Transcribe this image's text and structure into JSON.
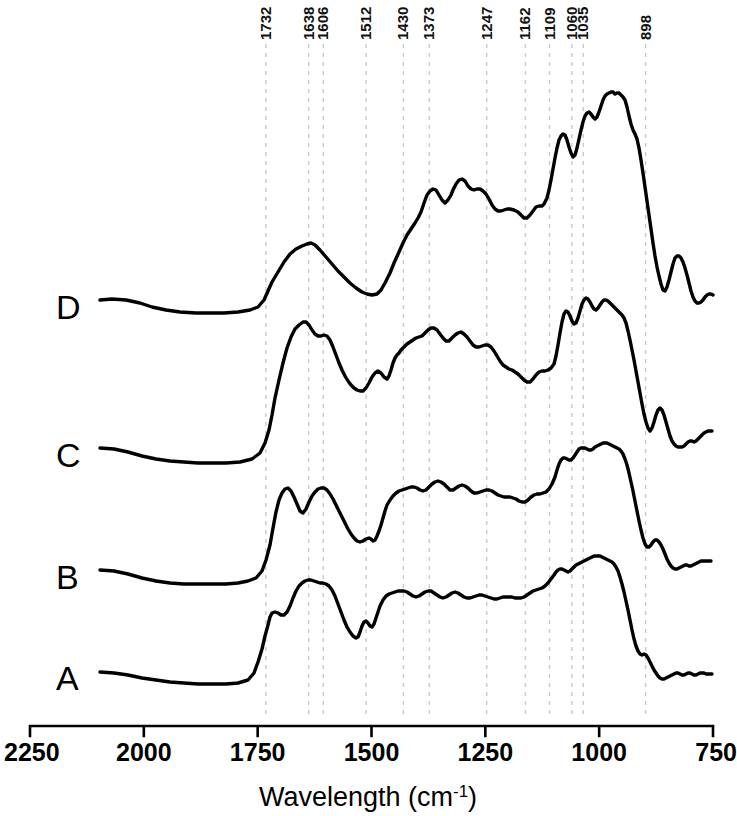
{
  "chart_data": {
    "type": "line",
    "title": "",
    "xlabel": "Wavelength (cm-1)",
    "xlabel_main": "Wavelength  (cm",
    "xlabel_sup": "-1",
    "xlabel_close": ")",
    "ylabel": "",
    "xlim": [
      2250,
      750
    ],
    "x_reversed": true,
    "grid": false,
    "legend_position": "inline-left",
    "xticks": [
      2250,
      2000,
      1750,
      1500,
      1250,
      1000,
      750
    ],
    "xtick_labels": [
      "2250",
      "2000",
      "1750",
      "1500",
      "1250",
      "1000",
      "750"
    ],
    "peak_annotations": [
      {
        "label": "1732",
        "wavenumber": 1732
      },
      {
        "label": "1638",
        "wavenumber": 1638
      },
      {
        "label": "1606",
        "wavenumber": 1606
      },
      {
        "label": "1512",
        "wavenumber": 1512
      },
      {
        "label": "1430",
        "wavenumber": 1430
      },
      {
        "label": "1373",
        "wavenumber": 1373
      },
      {
        "label": "1247",
        "wavenumber": 1247
      },
      {
        "label": "1162",
        "wavenumber": 1162
      },
      {
        "label": "1109",
        "wavenumber": 1109
      },
      {
        "label": "1060",
        "wavenumber": 1060
      },
      {
        "label": "1035",
        "wavenumber": 1035
      },
      {
        "label": "898",
        "wavenumber": 898
      }
    ],
    "series": [
      {
        "name": "D",
        "label": "D",
        "baseline_y": 307,
        "points": "100,300 112,299 126,300 140,303 152,307 166,310 180,312 196,313 210,313 224,313 238,312 250,310 258,307 264,300 268,291 272,282 278,272 284,262 290,254 296,249 302,246 307,244 311,243 315,245 320,250 326,257 332,264 338,271 344,277 350,283 356,288 362,292 367,294 372,295 377,294 381,290 385,283 390,273 394,263 399,252 403,243 407,235 411,229 415,223 418,218 421,212 424,203 427,195 430,191 433,189 436,190 439,195 442,200 445,203 448,200 451,195 453,190 456,184 459,180 462,179 465,181 468,186 471,189 474,190 477,189 480,189 483,191 486,194 489,199 492,205 495,209 498,211 501,211 504,210 507,209 510,209 514,210 518,212 521,215 524,218 527,218 530,215 533,211 536,207 539,206 542,206 544,204 547,198 549,190 551,180 553,169 555,158 557,148 559,140 561,136 563,134 565,135 567,140 569,147 571,153 573,157 575,155 577,148 579,139 581,130 583,122 585,116 587,113 589,112 591,114 593,117 595,119 597,117 599,112 601,106 603,100 605,96 607,94 609,93 611,92 613,92 615,94 617,93 619,93 621,95 623,97 625,100 627,107 629,116 631,124 633,130 635,134 637,139 639,148 641,160 643,173 645,187 647,201 649,215 651,229 653,243 655,256 657,267 659,276 661,284 663,290 665,291 667,287 669,280 671,272 673,264 675,258 677,256 679,256 681,258 683,262 685,268 687,275 689,283 691,291 693,297 695,301 697,303 699,303 701,302 703,300 705,297 707,295 709,294 711,294 713,295"
      },
      {
        "name": "C",
        "label": "C",
        "baseline_y": 455,
        "points": "100,448 114,449 128,452 142,456 156,459 170,461 184,462 198,463 212,463 226,463 240,462 252,459 260,453 265,443 269,430 272,415 275,398 279,380 283,363 287,348 291,337 295,329 299,325 303,322 306,322 309,325 312,330 315,334 318,336 321,336 324,335 327,336 330,340 333,347 336,355 339,363 342,370 345,376 348,381 351,385 354,388 357,390 360,391 363,391 366,388 369,383 372,377 375,373 378,371 381,373 384,377 387,379 389,376 391,370 393,363 395,358 397,355 399,353 401,350 404,347 407,344 410,342 413,340 416,338 419,337 422,336 425,333 428,330 431,328 434,328 437,330 440,334 443,338 446,341 449,341 452,338 455,335 458,333 461,332 464,334 467,337 470,341 473,345 476,347 479,347 482,346 485,345 488,345 491,347 494,351 497,356 500,361 503,365 506,367 509,369 512,370 515,372 518,374 521,377 524,380 527,382 530,382 533,379 536,375 539,372 542,371 545,371 548,370 551,368 554,364 556,356 558,345 560,333 562,322 564,314 566,311 568,312 570,316 572,321 574,324 576,323 578,318 580,311 582,304 584,300 586,298 588,299 590,302 592,306 594,309 596,310 598,308 600,305 602,302 604,300 606,300 608,301 610,303 612,305 614,307 616,309 618,311 620,313 622,315 624,318 626,323 628,331 630,340 632,350 634,360 636,371 638,382 640,393 642,404 644,414 646,422 648,428 650,431 652,428 654,422 656,415 658,410 660,408 662,410 664,415 666,422 668,429 670,436 672,441 674,444 676,446 678,447 680,447 682,447 684,446 686,444 688,442 690,441 692,441 694,442 696,441 698,439 700,437 702,435 704,433 706,432 708,431 710,431 712,431"
      },
      {
        "name": "B",
        "label": "B",
        "baseline_y": 577,
        "points": "100,570 114,571 128,574 142,578 156,581 170,583 184,584 198,584 212,584 226,584 238,583 248,581 256,578 262,571 266,560 270,545 273,528 276,512 279,500 282,493 285,489 288,488 291,491 294,497 297,504 300,511 303,513 306,509 309,502 312,496 315,492 318,489 321,488 324,488 327,490 330,494 333,499 336,505 339,511 342,517 345,523 348,529 351,534 354,538 357,541 360,542 363,541 366,539 369,538 371,539 373,541 375,540 377,536 379,531 381,525 383,518 385,511 387,505 390,500 393,496 396,493 399,491 402,490 405,489 408,488 411,487 414,487 417,488 420,490 423,491 426,490 429,487 432,484 435,482 438,481 441,482 444,484 447,487 450,490 453,490 456,488 459,486 462,485 465,486 468,488 471,491 474,493 477,493 480,492 483,491 486,490 489,490 492,491 495,493 498,495 501,496 504,497 507,497 510,497 513,498 516,499 519,501 522,502 525,502 528,500 531,497 534,495 537,494 540,494 543,493 546,492 549,489 552,484 555,477 557,470 559,464 561,460 563,458 565,458 567,459 569,460 571,460 573,458 575,455 577,452 579,449 581,448 583,448 585,448 587,449 589,450 591,450 593,449 595,447 597,446 599,445 601,444 603,443 605,443 607,443 609,444 611,445 613,446 615,447 617,448 619,449 621,451 623,454 625,459 627,465 629,473 631,482 633,491 635,501 637,511 639,521 641,530 643,538 645,544 647,547 649,547 651,545 653,542 655,540 657,540 659,542 661,545 663,549 665,554 667,559 669,563 671,566 673,568 675,569 677,569 679,568 681,567 683,566 685,565 687,565 689,566 691,566 693,565 695,564 697,563 699,562 701,561 703,561 705,561 707,561 709,561 711,561"
      },
      {
        "name": "A",
        "label": "A",
        "baseline_y": 678,
        "points": "100,672 114,673 128,675 142,678 156,680 170,682 184,683 198,684 212,684 226,684 238,683 248,680 254,673 258,662 262,649 265,636 268,625 270,617 272,613 275,612 278,613 281,615 284,615 287,612 290,606 293,598 296,591 299,586 302,583 305,581 308,580 311,580 314,581 317,582 320,583 323,583 326,584 329,586 332,590 335,596 338,604 341,612 344,620 347,627 350,632 353,636 356,638 358,637 360,632 362,626 364,622 366,621 368,623 370,626 372,627 374,624 376,618 378,612 380,606 383,600 386,596 389,594 392,593 395,592 398,591 401,591 404,591 407,592 410,594 413,596 416,597 419,596 422,594 425,592 428,591 431,591 434,593 437,595 440,597 443,598 446,597 449,595 452,593 455,592 458,593 461,595 464,597 467,598 470,598 473,597 476,596 479,595 482,595 485,596 488,597 491,598 494,599 497,599 500,598 503,597 506,597 509,597 512,597 515,598 518,598 521,598 524,597 527,595 530,593 533,591 536,590 539,589 542,588 545,586 548,583 551,579 554,575 556,572 558,570 560,569 562,569 564,570 566,571 568,572 570,571 572,569 574,567 576,565 578,564 580,563 582,562 584,561 586,560 588,559 590,558 592,557 594,556 596,556 598,556 600,556 602,557 604,558 606,559 608,560 610,561 612,562 614,564 616,567 618,571 620,577 622,584 624,592 626,601 628,610 630,620 632,630 634,639 636,646 638,651 640,654 642,655 644,654 646,655 648,658 650,662 652,666 654,670 656,673 658,676 660,678 662,679 664,679 666,678 668,677 670,676 672,675 674,674 676,673 678,673 680,674 682,675 684,675 686,674 688,673 690,673 692,674 694,675 696,675 698,674 700,673 702,673 704,673 706,674 708,674 710,674 712,674"
      }
    ]
  },
  "colors": {
    "curve": "#000000",
    "guide": "#c9c9c9",
    "axis": "#000000",
    "background": "#ffffff"
  }
}
